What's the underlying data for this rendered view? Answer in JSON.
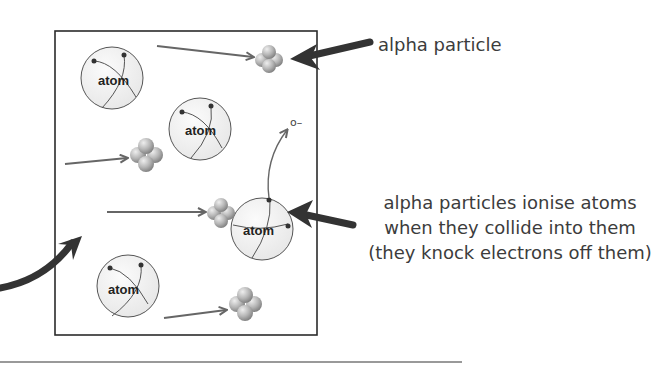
{
  "diagram": {
    "labels": {
      "alpha_particle": "alpha particle",
      "ionise_line1": "alpha particles ionise atoms",
      "ionise_line2": "when they collide into them",
      "ionise_line3": "(they knock electrons off them)"
    },
    "atom_label": "atom",
    "electron_label": "o–",
    "atoms": [
      {
        "id": "atom-1",
        "cx": 112,
        "cy": 78,
        "r": 31
      },
      {
        "id": "atom-2",
        "cx": 200,
        "cy": 129,
        "r": 31
      },
      {
        "id": "atom-3",
        "cx": 262,
        "cy": 229,
        "r": 31
      },
      {
        "id": "atom-4",
        "cx": 128,
        "cy": 286,
        "r": 31
      }
    ],
    "alpha_particles": [
      {
        "id": "alpha-1",
        "cx": 269,
        "cy": 58
      },
      {
        "id": "alpha-2",
        "cx": 146,
        "cy": 156
      },
      {
        "id": "alpha-3",
        "cx": 221,
        "cy": 213
      },
      {
        "id": "alpha-4",
        "cx": 245,
        "cy": 305
      }
    ],
    "colors": {
      "box_border": "#2b2b2b",
      "arrow_thin": "#666666",
      "arrow_thick": "#333333",
      "text": "#3c3c3c",
      "alpha_sphere": "#b8b8b8"
    }
  }
}
